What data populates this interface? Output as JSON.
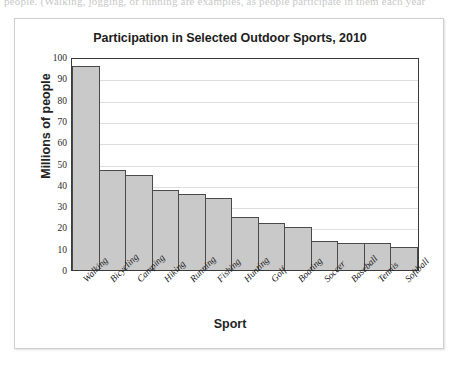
{
  "page": {
    "top_text_sliver": "people. (Walking, jogging, or running are examples, as people participate in them each year"
  },
  "chart_data": {
    "type": "bar",
    "title": "Participation in Selected Outdoor Sports, 2010",
    "xlabel": "Sport",
    "ylabel": "Millions of people",
    "ylim": [
      0,
      100
    ],
    "ytick_step": 10,
    "yticks": [
      100,
      90,
      80,
      70,
      60,
      50,
      40,
      30,
      20,
      10,
      0
    ],
    "grid": true,
    "legend": null,
    "bar_fill_color": "#c9c9c9",
    "bar_edge_color": "#4a4a4a",
    "categories": [
      "Walking",
      "Bicycling",
      "Camping",
      "Hiking",
      "Running",
      "Fishing",
      "Hunting",
      "Golf",
      "Boating",
      "Soccer",
      "Baseball",
      "Tennis",
      "Softball"
    ],
    "values": [
      96,
      47,
      44.5,
      37.5,
      35.5,
      34,
      25,
      22,
      20,
      13.5,
      12.5,
      12.5,
      11
    ]
  }
}
